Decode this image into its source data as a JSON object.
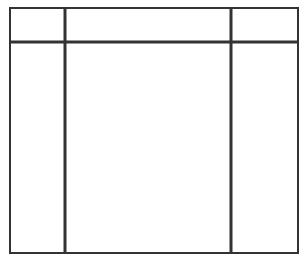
{
  "diagram": {
    "type": "empty-grid-table",
    "line_color": "#333333",
    "background": "#ffffff",
    "outer_frame": {
      "x1": 10,
      "y1": 8,
      "x2": 298,
      "y2": 253
    },
    "columns": 3,
    "rows": 2,
    "column_dividers_x": [
      65,
      231
    ],
    "row_dividers_y": [
      42
    ],
    "cells": [
      {
        "row": 0,
        "col": 0,
        "text": ""
      },
      {
        "row": 0,
        "col": 1,
        "text": ""
      },
      {
        "row": 0,
        "col": 2,
        "text": ""
      },
      {
        "row": 1,
        "col": 0,
        "text": ""
      },
      {
        "row": 1,
        "col": 1,
        "text": ""
      },
      {
        "row": 1,
        "col": 2,
        "text": ""
      }
    ]
  }
}
